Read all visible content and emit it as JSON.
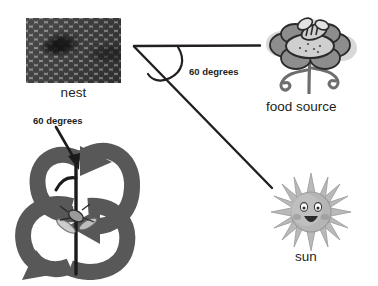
{
  "diagram": {
    "background_color": "#ffffff",
    "line_color": "#231f20",
    "text_color": "#231f20"
  },
  "labels": {
    "nest": "nest",
    "food_source": "food source",
    "sun": "sun",
    "angle_top": "60 degrees",
    "angle_dance": "60 degrees"
  },
  "icons": {
    "nest": "honeycomb-photo",
    "food_source": "flower-with-bee-icon",
    "sun": "smiling-sun-icon",
    "dance": "waggle-dance-figure-eight-icon",
    "bee": "bee-icon",
    "pointer": "arrow-pointer-icon"
  },
  "geometry": {
    "vertex_x": 134,
    "vertex_y": 46,
    "horizontal_end_x": 260,
    "horizontal_end_y": 46,
    "diagonal_end_x": 272,
    "diagonal_end_y": 188,
    "angle_degrees": 60
  },
  "colors": {
    "arrow_gray": "#585858",
    "sun_body": "#a8a8a8",
    "flower_petal": "#8a8a8a",
    "ink": "#231f20"
  }
}
